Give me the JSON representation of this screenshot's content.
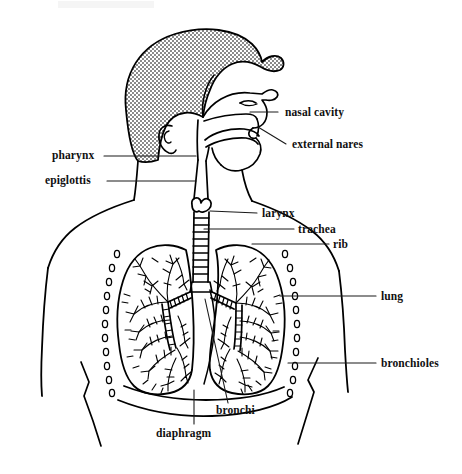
{
  "figure": {
    "width": 462,
    "height": 474,
    "style": "black-and-white line art with stippled gray hair shading"
  },
  "colors": {
    "ink": "#000000",
    "paper": "#ffffff",
    "hair_fill": "#b8b8b8",
    "leader_line": "#1a1a1a"
  },
  "labels": [
    {
      "id": "nasal-cavity",
      "text": "nasal cavity",
      "side": "right",
      "x": 285,
      "y": 107,
      "leader": {
        "x1": 278,
        "y1": 112,
        "x2": 250,
        "y2": 112
      }
    },
    {
      "id": "external-nares",
      "text": "external nares",
      "side": "right",
      "x": 292,
      "y": 139,
      "leader": {
        "x1": 286,
        "y1": 144,
        "x2": 258,
        "y2": 127
      }
    },
    {
      "id": "pharynx",
      "text": "pharynx",
      "side": "left",
      "x": 52,
      "y": 150,
      "leader": {
        "x1": 104,
        "y1": 156,
        "x2": 196,
        "y2": 156
      }
    },
    {
      "id": "epiglottis",
      "text": "epiglottis",
      "side": "left",
      "x": 45,
      "y": 175,
      "leader": {
        "x1": 107,
        "y1": 181,
        "x2": 196,
        "y2": 181
      }
    },
    {
      "id": "larynx",
      "text": "larynx",
      "side": "right",
      "x": 262,
      "y": 208,
      "leader": {
        "x1": 257,
        "y1": 213,
        "x2": 210,
        "y2": 211
      }
    },
    {
      "id": "trachea",
      "text": "trachea",
      "side": "right",
      "x": 298,
      "y": 224,
      "leader": {
        "x1": 294,
        "y1": 229,
        "x2": 204,
        "y2": 229
      }
    },
    {
      "id": "rib",
      "text": "rib",
      "side": "right",
      "x": 333,
      "y": 239,
      "leader": {
        "x1": 329,
        "y1": 244,
        "x2": 252,
        "y2": 244
      }
    },
    {
      "id": "lung",
      "text": "lung",
      "side": "right",
      "x": 381,
      "y": 291,
      "leader": {
        "x1": 376,
        "y1": 296,
        "x2": 280,
        "y2": 296
      }
    },
    {
      "id": "bronchioles",
      "text": "bronchioles",
      "side": "right",
      "x": 381,
      "y": 358,
      "leader": {
        "x1": 376,
        "y1": 363,
        "x2": 288,
        "y2": 363
      }
    },
    {
      "id": "bronchi",
      "text": "bronchi",
      "side": "bottom",
      "x": 216,
      "y": 405,
      "leader": {
        "x1": 228,
        "y1": 403,
        "x2": 205,
        "y2": 299
      }
    },
    {
      "id": "diaphragm",
      "text": "diaphragm",
      "side": "bottom",
      "x": 156,
      "y": 428,
      "leader": {
        "x1": 194,
        "y1": 424,
        "x2": 194,
        "y2": 390
      }
    }
  ],
  "anatomy_parts": [
    "nasal cavity",
    "external nares",
    "pharynx",
    "epiglottis",
    "larynx",
    "trachea",
    "rib",
    "lung",
    "bronchioles",
    "bronchi",
    "diaphragm"
  ]
}
